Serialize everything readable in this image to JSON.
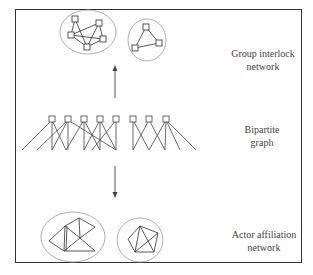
{
  "figure": {
    "labels": {
      "group_interlock": [
        "Group interlock",
        "network"
      ],
      "bipartite": [
        "Bipartite",
        "graph"
      ],
      "actor_affiliation": [
        "Actor affiliation",
        "network"
      ]
    },
    "colors": {
      "frame": "#333333",
      "edge": "#444444",
      "ellipse": "#999999",
      "text": "#444444"
    },
    "arrows": [
      {
        "direction": "up",
        "from": "bipartite",
        "to": "group_interlock"
      },
      {
        "direction": "down",
        "from": "bipartite",
        "to": "actor_affiliation"
      }
    ],
    "group_interlock_components": [
      {
        "node_count": 5,
        "shape": "square-nodes"
      },
      {
        "node_count": 3,
        "shape": "square-nodes triangle"
      }
    ],
    "bipartite": {
      "group_node_count": 8,
      "actor_node_count": 12
    },
    "actor_affiliation_components": [
      {
        "description": "two triangles joined with a chain"
      },
      {
        "description": "pentagon with internal chords"
      }
    ]
  }
}
